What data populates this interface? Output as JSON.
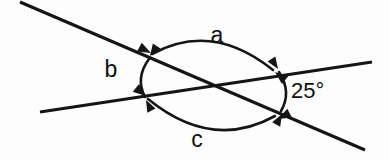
{
  "diagram": {
    "background_color": "#fdfdfd",
    "stroke_color": "#151515",
    "labels": {
      "angle_a": "a",
      "angle_b": "b",
      "angle_c": "c",
      "angle_known": "25°"
    },
    "lines": [
      {
        "name": "descending-line",
        "x1": 20,
        "y1": 2,
        "x2": 365,
        "y2": 150
      },
      {
        "name": "ascending-line",
        "x1": 40,
        "y1": 112,
        "x2": 372,
        "y2": 62
      }
    ],
    "intersection": {
      "x": 211,
      "y": 85
    },
    "arcs": [
      {
        "name": "arc-a",
        "label": "a",
        "path": "M 150 53 Q 212 20 274 71",
        "start_arrow": {
          "x": 152,
          "y": 54,
          "angle": 208
        },
        "end_arrow": {
          "x": 274,
          "y": 72,
          "angle": 40
        }
      },
      {
        "name": "arc-b",
        "label": "b",
        "path": "M 149 58 Q 134 78 145 98",
        "start_arrow": {
          "x": 149,
          "y": 57,
          "angle": -55
        },
        "end_arrow": {
          "x": 146,
          "y": 99,
          "angle": 62
        }
      },
      {
        "name": "arc-c",
        "label": "c",
        "path": "M 147 98 Q 212 152 276 117",
        "start_arrow": {
          "x": 146,
          "y": 97,
          "angle": -140
        },
        "end_arrow": {
          "x": 277,
          "y": 118,
          "angle": -28
        }
      },
      {
        "name": "arc-known-angle",
        "label": "25°",
        "path": "M 279 71 Q 292 92 281 112",
        "start_arrow": {
          "x": 279,
          "y": 70,
          "angle": -122
        },
        "end_arrow": {
          "x": 281,
          "y": 113,
          "angle": 118
        }
      }
    ],
    "label_positions": {
      "angle_a": {
        "x": 217,
        "y": 37
      },
      "angle_b": {
        "x": 111,
        "y": 71
      },
      "angle_c": {
        "x": 197,
        "y": 141
      },
      "angle_known": {
        "x": 291,
        "y": 92
      }
    }
  }
}
